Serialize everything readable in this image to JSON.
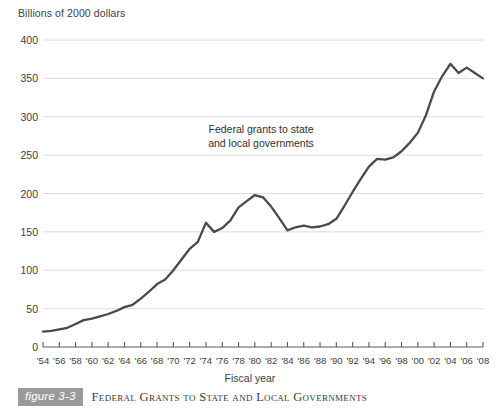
{
  "chart_data": {
    "type": "line",
    "title": "Federal Grants to State and Local Governments",
    "figure_number": "figure 3-3",
    "ylabel": "Billions of 2000 dollars",
    "xlabel": "Fiscal year",
    "annotation": {
      "line1": "Federal grants to state",
      "line2": "and local governments"
    },
    "ylim": [
      0,
      400
    ],
    "ytick_values": [
      0,
      50,
      100,
      150,
      200,
      250,
      300,
      350,
      400
    ],
    "ytick_labels": [
      "0",
      "50",
      "100",
      "150",
      "200",
      "250",
      "300",
      "350",
      "400"
    ],
    "xlim": [
      1954,
      2008
    ],
    "xtick_values": [
      1954,
      1956,
      1958,
      1960,
      1962,
      1964,
      1966,
      1968,
      1970,
      1972,
      1974,
      1976,
      1978,
      1980,
      1982,
      1984,
      1986,
      1988,
      1990,
      1992,
      1994,
      1996,
      1998,
      2000,
      2002,
      2004,
      2006,
      2008
    ],
    "xtick_labels": [
      "'54",
      "'56",
      "'58",
      "'60",
      "'62",
      "'64",
      "'66",
      "'68",
      "'70",
      "'72",
      "'74",
      "'76",
      "'78",
      "'80",
      "'82",
      "'84",
      "'86",
      "'88",
      "'90",
      "'92",
      "'94",
      "'96",
      "'98",
      "'00",
      "'02",
      "'04",
      "'06",
      "'08"
    ],
    "grid": "horizontal",
    "legend": "none",
    "line_color": "#4a4a4a",
    "grid_color": "#dcdcdc",
    "series": [
      {
        "name": "Federal grants to state and local governments",
        "x": [
          1954,
          1955,
          1956,
          1957,
          1958,
          1959,
          1960,
          1961,
          1962,
          1963,
          1964,
          1965,
          1966,
          1967,
          1968,
          1969,
          1970,
          1971,
          1972,
          1973,
          1974,
          1975,
          1976,
          1977,
          1978,
          1979,
          1980,
          1981,
          1982,
          1983,
          1984,
          1985,
          1986,
          1987,
          1988,
          1989,
          1990,
          1991,
          1992,
          1993,
          1994,
          1995,
          1996,
          1997,
          1998,
          1999,
          2000,
          2001,
          2002,
          2003,
          2004,
          2005,
          2006,
          2007,
          2008
        ],
        "values": [
          20,
          21,
          23,
          25,
          30,
          35,
          37,
          40,
          43,
          47,
          52,
          55,
          63,
          72,
          82,
          88,
          100,
          114,
          128,
          137,
          162,
          150,
          155,
          165,
          182,
          190,
          198,
          195,
          183,
          168,
          152,
          156,
          158,
          156,
          157,
          160,
          167,
          184,
          202,
          219,
          235,
          245,
          244,
          247,
          255,
          266,
          279,
          302,
          333,
          353,
          369,
          357,
          364,
          357,
          350
        ]
      }
    ]
  }
}
